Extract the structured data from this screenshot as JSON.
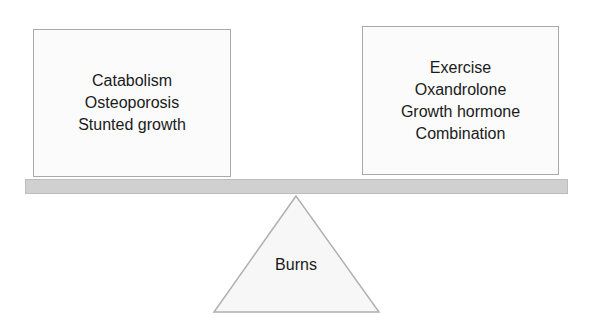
{
  "diagram": {
    "type": "balance-scale",
    "left_side": {
      "items": [
        "Catabolism",
        "Osteoporosis",
        "Stunted growth"
      ]
    },
    "right_side": {
      "items": [
        "Exercise",
        "Oxandrolone",
        "Growth hormone",
        "Combination"
      ]
    },
    "fulcrum": {
      "label": "Burns"
    },
    "colors": {
      "box_border": "#a9a9a9",
      "box_fill": "#fbfbfb",
      "beam_fill": "#d0d0d0",
      "triangle_fill": "#f7f7f7",
      "triangle_stroke": "#b0b0b0",
      "text": "#1a1a1a"
    }
  }
}
